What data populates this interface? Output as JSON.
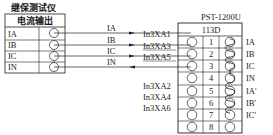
{
  "left_device": {
    "title": "继保测试仪",
    "header": "电流输出",
    "rows": [
      {
        "label": "IA"
      },
      {
        "label": "IB"
      },
      {
        "label": "IC"
      },
      {
        "label": "IN"
      }
    ]
  },
  "wires": [
    {
      "signal": "IA",
      "terminal": "In3XA1",
      "direction": "to-right"
    },
    {
      "signal": "IB",
      "terminal": "In3XA3",
      "direction": "to-right"
    },
    {
      "signal": "IC",
      "terminal": "In3XA5",
      "direction": "to-right"
    },
    {
      "signal": "IN",
      "terminal": "",
      "direction": "to-left"
    }
  ],
  "extra_terminals": [
    "In3XA2",
    "In3XA4",
    "In3XA6"
  ],
  "right_device": {
    "title": "PST-1200U",
    "block": "113D",
    "rows": [
      {
        "num": "1",
        "label": "IA"
      },
      {
        "num": "2",
        "label": "IB"
      },
      {
        "num": "3",
        "label": "IC"
      },
      {
        "num": "4",
        "label": "IN"
      },
      {
        "num": "5",
        "label": "IA'"
      },
      {
        "num": "6",
        "label": "IB'"
      },
      {
        "num": "7",
        "label": "IC'"
      },
      {
        "num": "8",
        "label": ""
      }
    ]
  }
}
